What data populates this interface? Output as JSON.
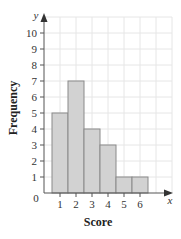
{
  "chart_data": {
    "type": "bar",
    "subtype": "histogram",
    "title": "",
    "xlabel": "Score",
    "ylabel": "Frequency",
    "x_axis_var": "x",
    "y_axis_var": "y",
    "origin_label": "0",
    "categories": [
      "1",
      "2",
      "3",
      "4",
      "5",
      "6"
    ],
    "values": [
      5,
      7,
      4,
      3,
      1,
      1
    ],
    "x_ticks": [
      "1",
      "2",
      "3",
      "4",
      "5",
      "6"
    ],
    "y_ticks": [
      "1",
      "2",
      "3",
      "4",
      "5",
      "6",
      "7",
      "8",
      "9",
      "10"
    ],
    "ylim": [
      0,
      10
    ],
    "xlim": [
      0,
      8
    ],
    "grid": true,
    "legend": null,
    "colors": {
      "bar_fill": "#d2d2d2",
      "bar_stroke": "#8a8a8a",
      "grid": "#e6e6e6",
      "axis": "#555555"
    }
  }
}
